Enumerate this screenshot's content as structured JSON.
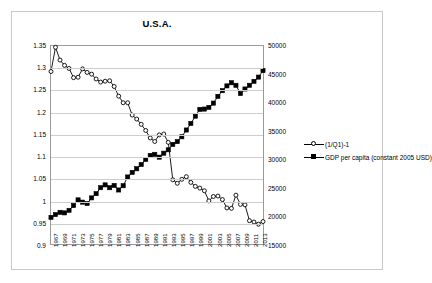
{
  "chart_data": {
    "type": "line",
    "title": "U.S.A.",
    "xlabel": "",
    "ylabel": "",
    "grid": true,
    "legend_position": "right-middle",
    "x": [
      1967,
      1968,
      1969,
      1970,
      1971,
      1972,
      1973,
      1974,
      1975,
      1976,
      1977,
      1978,
      1979,
      1980,
      1981,
      1982,
      1983,
      1984,
      1985,
      1986,
      1987,
      1988,
      1989,
      1990,
      1991,
      1992,
      1993,
      1994,
      1995,
      1996,
      1997,
      1998,
      1999,
      2000,
      2001,
      2002,
      2003,
      2004,
      2005,
      2006,
      2007,
      2008,
      2009,
      2010,
      2011,
      2012,
      2013,
      2014
    ],
    "xtick_labels": [
      "1967",
      "1969",
      "1971",
      "1973",
      "1975",
      "1977",
      "1979",
      "1981",
      "1983",
      "1985",
      "1987",
      "1989",
      "1991",
      "1993",
      "1995",
      "1997",
      "1999",
      "2001",
      "2003",
      "2005",
      "2007",
      "2009",
      "2011",
      "2013"
    ],
    "left_axis": {
      "ylim": [
        0.9,
        1.35
      ],
      "ticks": [
        0.9,
        0.95,
        1,
        1.05,
        1.1,
        1.15,
        1.2,
        1.25,
        1.3,
        1.35
      ],
      "tick_labels": [
        "0.9",
        "0.95",
        "1",
        "1.05",
        "1.1",
        "1.15",
        "1.2",
        "1.25",
        "1.3",
        "1.35"
      ]
    },
    "right_axis": {
      "ylim": [
        15000,
        50000
      ],
      "ticks": [
        15000,
        20000,
        25000,
        30000,
        35000,
        40000,
        45000,
        50000
      ],
      "tick_labels": [
        "15000",
        "20000",
        "25000",
        "30000",
        "35000",
        "40000",
        "45000",
        "50000"
      ]
    },
    "series": [
      {
        "name": "(1/Q1)-1",
        "axis": "left",
        "marker": "open-circle",
        "color": "#000000",
        "values": [
          1.292,
          1.347,
          1.318,
          1.306,
          1.299,
          1.278,
          1.279,
          1.298,
          1.29,
          1.286,
          1.275,
          1.268,
          1.27,
          1.271,
          1.258,
          1.236,
          1.221,
          1.221,
          1.193,
          1.184,
          1.172,
          1.158,
          1.141,
          1.133,
          1.148,
          1.15,
          1.131,
          1.046,
          1.038,
          1.047,
          1.053,
          1.04,
          1.031,
          1.027,
          1.021,
          0.998,
          1.008,
          1.009,
          1.001,
          0.982,
          0.981,
          1.011,
          0.99,
          0.989,
          0.953,
          0.95,
          0.945,
          0.951
        ]
      },
      {
        "name": "GDP per capita (constant 2005 USD)",
        "axis": "right",
        "marker": "filled-square",
        "color": "#000000",
        "values": [
          19700,
          20200,
          20600,
          20500,
          20950,
          21800,
          22800,
          22400,
          22150,
          23150,
          23900,
          24950,
          25450,
          24950,
          25350,
          24550,
          25300,
          26850,
          27650,
          28300,
          29050,
          29950,
          30650,
          30850,
          30350,
          31050,
          31650,
          32600,
          33100,
          33950,
          35150,
          36300,
          37600,
          38800,
          38850,
          39150,
          39900,
          41100,
          42100,
          42950,
          43500,
          43050,
          41600,
          42400,
          43050,
          43750,
          44500,
          45650
        ]
      }
    ]
  },
  "legend": {
    "entries": [
      {
        "label": "(1/Q1)-1"
      },
      {
        "label": "GDP per capita (constant 2005 USD)"
      }
    ]
  }
}
